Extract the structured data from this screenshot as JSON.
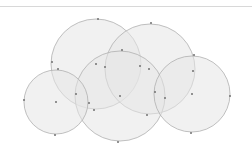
{
  "diagram": {
    "type": "overlapping-circles",
    "fill_color": "#e6e6e6",
    "fill_opacity": 0.55,
    "stroke_color": "#b0b0b0",
    "point_color": "#7a7a7a",
    "circles": [
      {
        "id": "A",
        "cx": 96,
        "cy": 64,
        "r": 45
      },
      {
        "id": "B",
        "cx": 150,
        "cy": 69,
        "r": 45
      },
      {
        "id": "C",
        "cx": 120,
        "cy": 96,
        "r": 45
      },
      {
        "id": "D",
        "cx": 56,
        "cy": 102,
        "r": 32
      },
      {
        "id": "E",
        "cx": 192,
        "cy": 94,
        "r": 38
      }
    ],
    "points": [
      {
        "x": 98,
        "y": 19
      },
      {
        "x": 151,
        "y": 23
      },
      {
        "x": 52,
        "y": 62
      },
      {
        "x": 58,
        "y": 69
      },
      {
        "x": 96,
        "y": 64
      },
      {
        "x": 105,
        "y": 67
      },
      {
        "x": 122,
        "y": 50
      },
      {
        "x": 140,
        "y": 66
      },
      {
        "x": 149,
        "y": 69
      },
      {
        "x": 194,
        "y": 55
      },
      {
        "x": 193,
        "y": 71
      },
      {
        "x": 24,
        "y": 100
      },
      {
        "x": 56,
        "y": 102
      },
      {
        "x": 76,
        "y": 94
      },
      {
        "x": 89,
        "y": 103
      },
      {
        "x": 94,
        "y": 110
      },
      {
        "x": 120,
        "y": 96
      },
      {
        "x": 155,
        "y": 92
      },
      {
        "x": 165,
        "y": 98
      },
      {
        "x": 147,
        "y": 115
      },
      {
        "x": 192,
        "y": 94
      },
      {
        "x": 230,
        "y": 96
      },
      {
        "x": 55,
        "y": 135
      },
      {
        "x": 118,
        "y": 142
      },
      {
        "x": 191,
        "y": 133
      }
    ]
  }
}
